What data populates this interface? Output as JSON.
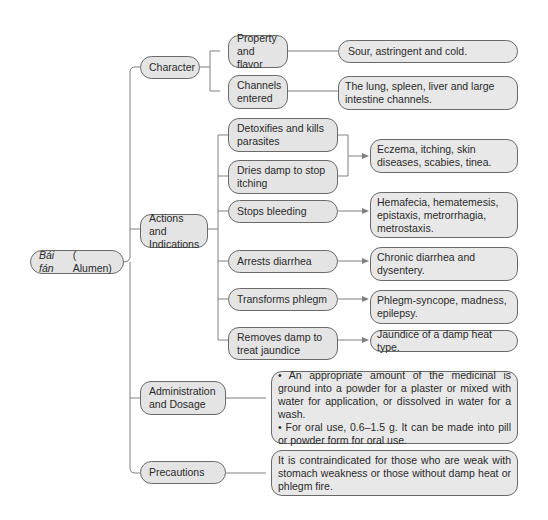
{
  "root": {
    "italic": "Bái fán",
    "label": "( Alumen)"
  },
  "branches": [
    {
      "label": "Character",
      "children": [
        {
          "label": "Property and flavor",
          "detail": "Sour, astringent and cold."
        },
        {
          "label": "Channels entered",
          "detail": "The lung, spleen, liver and large intestine channels."
        }
      ]
    },
    {
      "label": "Actions and Indications",
      "children": [
        {
          "label": "Detoxifies and kills parasites"
        },
        {
          "label": "Dries damp to stop itching"
        },
        {
          "label": "Stops bleeding",
          "detail": "Hemafecia, hematemesis, epistaxis, metrorrhagia, metrostaxis."
        },
        {
          "label": "Arrests diarrhea",
          "detail": "Chronic diarrhea and dysentery."
        },
        {
          "label": "Transforms phlegm",
          "detail": "Phlegm-syncope, madness, epilepsy."
        },
        {
          "label": "Removes damp to treat jaundice",
          "detail": "Jaundice of a damp heat type."
        }
      ],
      "shared_detail": "Eczema, itching, skin diseases, scabies, tinea."
    },
    {
      "label": "Administration and Dosage",
      "detail_bullets": [
        "• An appropriate amount of the medicinal is ground into a powder for a plaster or mixed with water for application, or dissolved in water for a wash.",
        "• For oral use, 0.6–1.5 g. It can be made into pill or powder form for oral use."
      ]
    },
    {
      "label": "Precautions",
      "detail": "It is contraindicated for those who are weak with stomach weakness or those without damp heat or phlegm fire."
    }
  ],
  "colors": {
    "node_fill": "#e4e4e4",
    "border": "#6a6a6a",
    "line": "#777777"
  }
}
